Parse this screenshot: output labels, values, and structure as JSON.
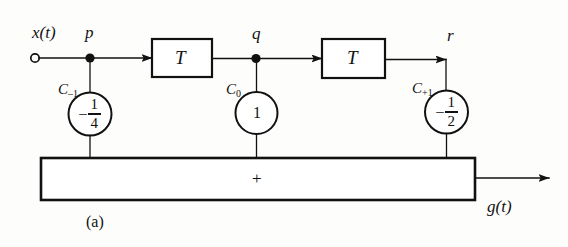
{
  "figure": {
    "caption": "(a)",
    "type": "block-diagram"
  },
  "signals": {
    "input_label": "x(t)",
    "output_label": "g(t)",
    "tap_p": "p",
    "tap_q": "q",
    "tap_r": "r"
  },
  "delay_blocks": [
    {
      "id": "delay-1",
      "label": "T"
    },
    {
      "id": "delay-2",
      "label": "T"
    }
  ],
  "coefficients": [
    {
      "id": "coef-minus-1",
      "name": "C",
      "subscript": "–1",
      "sign": "–",
      "numerator": "1",
      "denominator": "4",
      "value_text": "– 1/4",
      "tap": "p"
    },
    {
      "id": "coef-zero",
      "name": "C",
      "subscript": "0",
      "sign": "",
      "numerator": "",
      "denominator": "",
      "value_text": "1",
      "tap": "q"
    },
    {
      "id": "coef-plus-1",
      "name": "C",
      "subscript": "+1",
      "sign": "–",
      "numerator": "1",
      "denominator": "2",
      "value_text": "– 1/2",
      "tap": "r"
    }
  ],
  "summer": {
    "symbol": "+"
  },
  "colors": {
    "ink": "#111111",
    "background": "#fdfdfc"
  }
}
